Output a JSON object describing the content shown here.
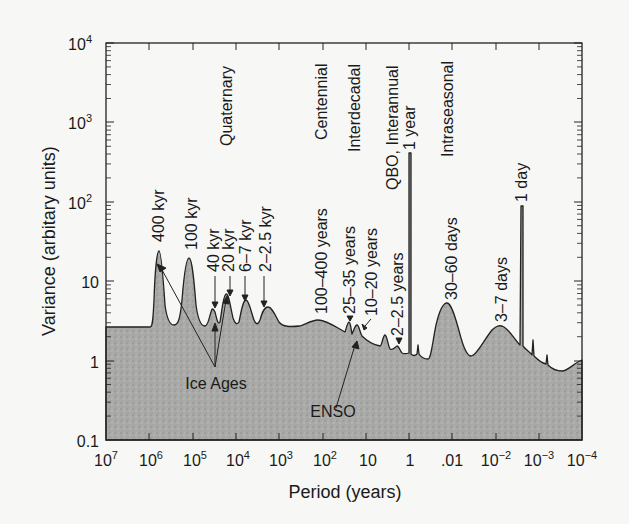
{
  "chart_data": {
    "type": "area",
    "title": "",
    "xlabel": "Period (years)",
    "ylabel": "Variance (arbitary units)",
    "x_scale": "log (reversed)",
    "y_scale": "log",
    "xlim": [
      10000000,
      0.0001
    ],
    "ylim": [
      0.1,
      10000
    ],
    "x_tick_labels": [
      "10^7",
      "10^6",
      "10^5",
      "10^4",
      "10^3",
      "10^2",
      "10",
      "1",
      ".01",
      "10^-2",
      "10^-3",
      "10^-4"
    ],
    "y_tick_labels": [
      "0.1",
      "1",
      "10",
      "10^2",
      "10^3",
      "10^4"
    ],
    "grid": false,
    "legend": null,
    "fill": "grey stippled",
    "baseline_variance": 2.7,
    "peaks": [
      {
        "label": "400 kyr",
        "period_years": 400000,
        "variance": 28
      },
      {
        "label": "100 kyr",
        "period_years": 100000,
        "variance": 21
      },
      {
        "label": "40 kyr",
        "period_years": 40000,
        "variance": 5
      },
      {
        "label": "20 kyr",
        "period_years": 20000,
        "variance": 9
      },
      {
        "label": "6–7 kyr",
        "period_years": 6500,
        "variance": 7
      },
      {
        "label": "2–2.5 kyr",
        "period_years": 2200,
        "variance": 5
      },
      {
        "label": "100–400 years",
        "period_years": 200,
        "variance": 3.5
      },
      {
        "label": "25–35 years",
        "period_years": 30,
        "variance": 3.3
      },
      {
        "label": "10–20 years",
        "period_years": 15,
        "variance": 3
      },
      {
        "label": "2–2.5 years",
        "period_years": 2.2,
        "variance": 1.6
      },
      {
        "label": "1 year",
        "period_years": 1,
        "variance": 450
      },
      {
        "label": "30–60 days",
        "period_years": 0.12,
        "variance": 5
      },
      {
        "label": "3–7 days",
        "period_years": 0.014,
        "variance": 2.5
      },
      {
        "label": "1 day",
        "period_years": 0.0027,
        "variance": 100
      }
    ],
    "band_labels": [
      "Quaternary",
      "Centennial",
      "Interdecadal",
      "QBO, Interannual",
      "Intraseasonal"
    ],
    "annotations": [
      "Ice Ages",
      "ENSO"
    ]
  },
  "labels": {
    "ylabel": "Variance (arbitary units)",
    "xlabel": "Period (years)",
    "yticks": [
      {
        "base": "10",
        "exp": "4"
      },
      {
        "base": "10",
        "exp": "3"
      },
      {
        "base": "10",
        "exp": "2"
      },
      {
        "base": "10",
        "exp": ""
      },
      {
        "base": "1",
        "exp": ""
      },
      {
        "base": "0.1",
        "exp": ""
      }
    ],
    "xticks": [
      {
        "base": "10",
        "exp": "7"
      },
      {
        "base": "10",
        "exp": "6"
      },
      {
        "base": "10",
        "exp": "5"
      },
      {
        "base": "10",
        "exp": "4"
      },
      {
        "base": "10",
        "exp": "3"
      },
      {
        "base": "10",
        "exp": "2"
      },
      {
        "base": "10",
        "exp": ""
      },
      {
        "base": "1",
        "exp": ""
      },
      {
        "base": ".01",
        "exp": ""
      },
      {
        "base": "10",
        "exp": "−2"
      },
      {
        "base": "10",
        "exp": "−3"
      },
      {
        "base": "10",
        "exp": "−4"
      }
    ],
    "bands": {
      "quaternary": "Quaternary",
      "centennial": "Centennial",
      "interdecadal": "Interdecadal",
      "qbo": "QBO, Interannual",
      "intraseasonal": "Intraseasonal"
    },
    "peaks": {
      "p400kyr": "400 kyr",
      "p100kyr": "100 kyr",
      "p40kyr": "40 kyr",
      "p20kyr": "20 kyr",
      "p67kyr": "6–7 kyr",
      "p225kyr": "2–2.5 kyr",
      "p100_400y": "100–400 years",
      "p25_35y": "25–35 years",
      "p10_20y": "10–20 years",
      "p2_25y": "2–2.5 years",
      "p1y": "1 year",
      "p30_60d": "30–60 days",
      "p3_7d": "3–7 days",
      "p1d": "1 day"
    },
    "annotations": {
      "ice_ages": "Ice Ages",
      "enso": "ENSO"
    }
  }
}
